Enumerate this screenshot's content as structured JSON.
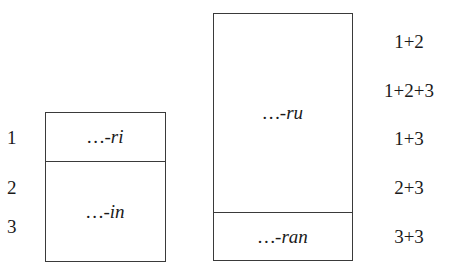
{
  "left_box": {
    "top_cell": "…-ri",
    "bottom_cell": "…-in",
    "row_labels": [
      "1",
      "2",
      "3"
    ]
  },
  "right_box": {
    "top_cell": "…-ru",
    "bottom_cell": "…-ran",
    "sum_labels": [
      "1+2",
      "1+2+3",
      "1+3",
      "2+3",
      "3+3"
    ]
  }
}
